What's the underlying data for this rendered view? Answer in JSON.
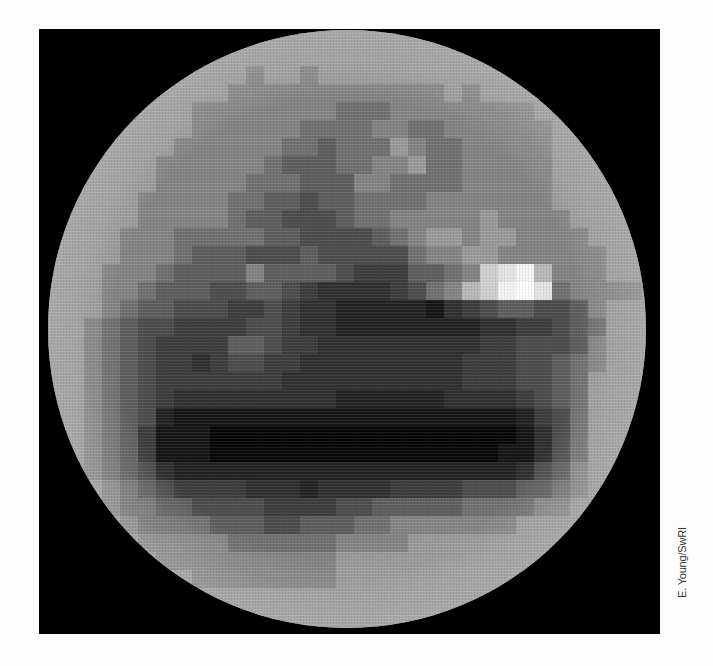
{
  "image": {
    "subject": "Pixelated grayscale map of a planetary disk (Pluto)",
    "credit": "E. Young/SwRI",
    "background_color": "#000000",
    "page_color": "#fdfdfd"
  },
  "disk": {
    "center_x": 347,
    "center_y": 330,
    "radius": 299,
    "block_size_px": 18,
    "grid_cols": 34,
    "grid_rows": 34,
    "rows": [
      "aaaaaaaaaaaaaaaaaaaaaaaaaaaaaaaaaa",
      "aaaaaaaaaaaaaaaaaaaaaaaaaaaaaaaaaa",
      "aaaaaaaaaaa9aa9aaaaaaaaaaaaaaaaaaa",
      "aaaaaaaaaa999999999999a9aaaaaaaaaa",
      "aaaaaaaa9999999988899999999aaaaaaa",
      "aaaaaaaa99999988889988999999aaaaaa",
      "aaaaaaa999999887888a98899999aaaaaa",
      "aaaaaa99999987778899a8899999aaaaaa",
      "aaaaaa9999988877799888899999aaaaaa",
      "aaaaa99999887767788889999999aaaaaa",
      "aaaaa9999987766678899999a9999aaaaa",
      "aaaa99988888776666789aa9aa9999aaaa",
      "aaaa9998777666766666899aa999999aaa",
      "aaa999877779777765557789cdeb999aaa",
      "aaa99877766776544445689bcefd89999a",
      "aaa9877666556544333332456776679aaa",
      "aa98766555566544333333334455678aaa",
      "aa98765555776554444444445566679aaa",
      "aa98765545665544444444455566789aaa",
      "aa9876555555544444444445556678aaaa",
      "aa9876544444444433333344445678aaaa",
      "aa9876322222222222222222223568aaaa",
      "aa9875222111111111111111112468aaaa",
      "aa9875222111111111111111122468aaaa",
      "aa9876433333333333333333334679aaaa",
      "aaa987655554443444455556667789aaaa",
      "aaa98877666655556677777888899aaaaa",
      "aaaa9888877766777889999999aaaaaaaa",
      "aaaaa999998888889999aaaaaaaaaaaaaa",
      "aaaaaa9999999999aaaaaaaaaaaaaaaaaa",
      "aaaaaaaa99999999aaaaaaaaaaaaaaaaaa",
      "aaaaaaaaaaaaaaaaaaaaaaaaaaaaaaaaaa",
      "aaaaaaaaaaaaaaaaaaaaaaaaaaaaaaaaaa",
      "aaaaaaaaaaaaaaaaaaaaaaaaaaaaaaaaaa"
    ],
    "palette": {
      "1": "#080808",
      "2": "#161616",
      "3": "#232323",
      "4": "#303030",
      "5": "#3d3d3d",
      "6": "#4d4d4d",
      "7": "#5e5e5e",
      "8": "#707070",
      "9": "#848484",
      "a": "#9a9a9a",
      "b": "#b8b8b8",
      "c": "#cfcfcf",
      "d": "#e3e3e3",
      "e": "#f2f2f2",
      "f": "#fdfdfd"
    }
  }
}
